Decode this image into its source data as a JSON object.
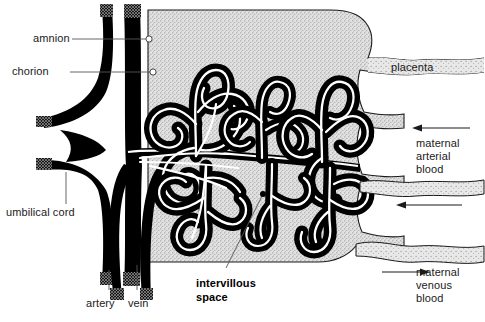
{
  "figure": {
    "kind": "anatomical-diagram",
    "background_color": "#ffffff",
    "ink_color": "#000000",
    "stipple_color": "#c9c9c9",
    "leader_color": "#555555",
    "text_color": "#1a1a1a"
  },
  "labels": {
    "amnion": "amnion",
    "chorion": "chorion",
    "umbilical_cord": "umbilical cord",
    "artery": "artery",
    "vein": "vein",
    "intervillous_space_line1": "intervillous",
    "intervillous_space_line2": "space",
    "placenta": "placenta",
    "maternal_arterial_line1": "maternal",
    "maternal_arterial_line2": "arterial",
    "maternal_arterial_line3": "blood",
    "maternal_venous_line1": "maternal",
    "maternal_venous_line2": "venous",
    "maternal_venous_line3": "blood"
  }
}
